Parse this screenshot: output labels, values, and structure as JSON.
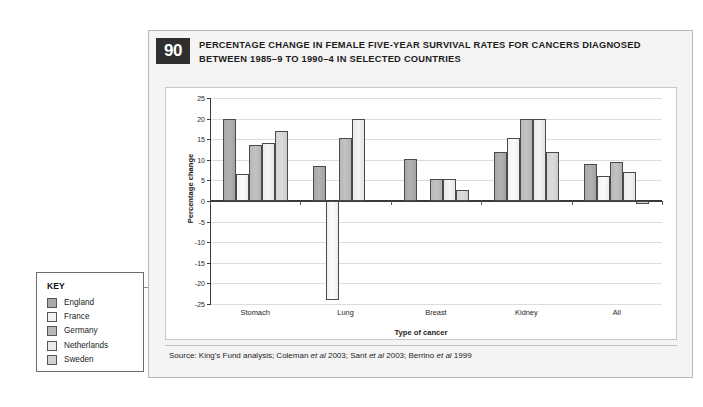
{
  "figure": {
    "number": "90",
    "title": "PERCENTAGE CHANGE IN FEMALE FIVE-YEAR SURVIVAL RATES FOR CANCERS DIAGNOSED BETWEEN 1985–9 TO 1990–4 IN SELECTED COUNTRIES",
    "source_prefix": "Source: King's Fund analysis; Coleman ",
    "source_etal1": "et al",
    "source_mid1": " 2003; Sant ",
    "source_etal2": "et al",
    "source_mid2": " 2003; Berrino ",
    "source_etal3": "et al",
    "source_suffix": " 1999"
  },
  "key": {
    "title": "KEY",
    "items": [
      {
        "label": "England",
        "color": "#a8a8a8"
      },
      {
        "label": "France",
        "color": "#f2f2f2"
      },
      {
        "label": "Germany",
        "color": "#b8b8b8"
      },
      {
        "label": "Netherlands",
        "color": "#eaeaea"
      },
      {
        "label": "Sweden",
        "color": "#d2d2d2"
      }
    ]
  },
  "chart_data": {
    "type": "bar",
    "title": "PERCENTAGE CHANGE IN FEMALE FIVE-YEAR SURVIVAL RATES FOR CANCERS DIAGNOSED BETWEEN 1985–9 TO 1990–4 IN SELECTED COUNTRIES",
    "xlabel": "Type of cancer",
    "ylabel": "Percentage change",
    "categories": [
      "Stomach",
      "Lung",
      "Breast",
      "Kidney",
      "All"
    ],
    "series": [
      {
        "name": "England",
        "color": "#a8a8a8",
        "values": [
          20.0,
          8.5,
          10.3,
          12.0,
          9.0
        ]
      },
      {
        "name": "France",
        "color": "#f2f2f2",
        "values": [
          6.5,
          -24.0,
          0.0,
          15.2,
          6.0
        ]
      },
      {
        "name": "Germany",
        "color": "#b8b8b8",
        "values": [
          13.5,
          15.3,
          5.3,
          20.0,
          9.5
        ]
      },
      {
        "name": "Netherlands",
        "color": "#eaeaea",
        "values": [
          14.0,
          20.0,
          5.3,
          20.0,
          7.0
        ]
      },
      {
        "name": "Sweden",
        "color": "#d2d2d2",
        "values": [
          17.0,
          0.0,
          2.7,
          12.0,
          -0.7
        ]
      }
    ],
    "ylim": [
      -25,
      25
    ],
    "yticks": [
      25,
      20,
      15,
      10,
      5,
      0,
      "-5",
      "-10",
      "-15",
      "-20",
      "-25"
    ],
    "ytick_values": [
      25,
      20,
      15,
      10,
      5,
      0,
      -5,
      -10,
      -15,
      -20,
      -25
    ],
    "grid": true,
    "legend_position": "external-left",
    "zero_line": true
  }
}
